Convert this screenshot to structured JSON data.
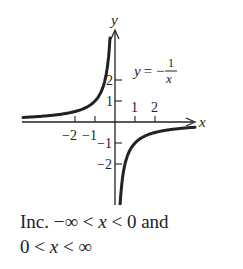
{
  "chart_data": {
    "type": "line",
    "title": "",
    "function_label": "y = -1/x",
    "function_label_parts": {
      "lhs": "y",
      "eq": "= −",
      "num": "1",
      "den": "x"
    },
    "xlabel": "x",
    "ylabel": "y",
    "xlim": [
      -4.6,
      4.0
    ],
    "ylim": [
      -4,
      4.4
    ],
    "x_ticks": [
      -2,
      -1,
      1,
      2
    ],
    "x_tick_labels": [
      "−2",
      "−1",
      "1",
      "2"
    ],
    "y_ticks": [
      1,
      2,
      -1,
      -2
    ],
    "y_tick_labels": [
      "1",
      "2",
      "−1",
      "−2"
    ],
    "grid": false,
    "series": [
      {
        "name": "left branch",
        "x": [
          -4.6,
          -3,
          -2,
          -1,
          -0.5,
          -0.3,
          -0.25
        ],
        "values": [
          0.22,
          0.33,
          0.5,
          1,
          2,
          3.33,
          4
        ]
      },
      {
        "name": "right branch",
        "x": [
          0.25,
          0.3,
          0.5,
          1,
          2,
          3,
          4.0
        ],
        "values": [
          -4,
          -3.33,
          -2,
          -1,
          -0.5,
          -0.33,
          -0.25
        ]
      }
    ]
  },
  "caption": {
    "line1_prefix": "Inc. −∞ < ",
    "line1_var": "x",
    "line1_suffix": " < 0 and",
    "line2_prefix": "0 < ",
    "line2_var": "x",
    "line2_suffix": " < ∞"
  }
}
